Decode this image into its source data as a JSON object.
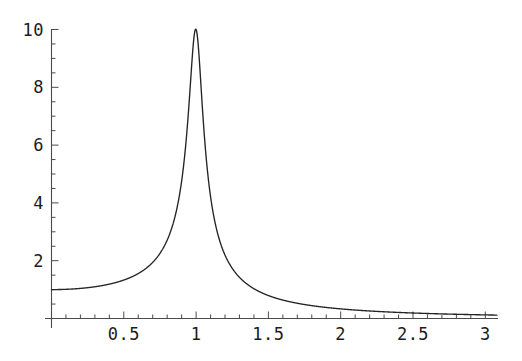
{
  "chart_data": {
    "type": "line",
    "title": "",
    "subtitle": "",
    "xlabel": "",
    "ylabel": "",
    "xlim": [
      0,
      3.08
    ],
    "ylim": [
      0,
      10.35
    ],
    "grid": false,
    "legend": null,
    "annotations": [],
    "line_color": "#242424",
    "axis_color": "#4a4a4a",
    "x_ticks_major": [
      0.5,
      1,
      1.5,
      2,
      2.5,
      3
    ],
    "x_tick_labels": [
      "0.5",
      "1",
      "1.5",
      "2",
      "2.5",
      "3"
    ],
    "x_ticks_minor": [
      0.1,
      0.2,
      0.3,
      0.4,
      0.6,
      0.7,
      0.8,
      0.9,
      1.1,
      1.2,
      1.3,
      1.4,
      1.6,
      1.7,
      1.8,
      1.9,
      2.1,
      2.2,
      2.3,
      2.4,
      2.6,
      2.7,
      2.8,
      2.9
    ],
    "y_ticks_major": [
      2,
      4,
      6,
      8,
      10
    ],
    "y_tick_labels": [
      "2",
      "4",
      "6",
      "8",
      "10"
    ],
    "y_ticks_minor": [
      0.5,
      1,
      1.5,
      2.5,
      3,
      3.5,
      4.5,
      5,
      5.5,
      6.5,
      7,
      7.5,
      8.5,
      9,
      9.5
    ],
    "peak": {
      "x": 1,
      "y": 10
    },
    "start_value": {
      "x": 0,
      "y": 1
    },
    "end_value": {
      "x": 3,
      "y": 0.13
    },
    "series": [
      {
        "name": "resonance amplitude",
        "x": [
          0,
          0.05,
          0.1,
          0.15,
          0.2,
          0.25,
          0.3,
          0.35,
          0.4,
          0.45,
          0.5,
          0.55,
          0.6,
          0.65,
          0.7,
          0.75,
          0.8,
          0.82,
          0.84,
          0.86,
          0.88,
          0.9,
          0.91,
          0.92,
          0.93,
          0.94,
          0.95,
          0.96,
          0.97,
          0.98,
          0.99,
          1.0,
          1.01,
          1.02,
          1.03,
          1.04,
          1.05,
          1.06,
          1.07,
          1.08,
          1.1,
          1.12,
          1.14,
          1.16,
          1.18,
          1.2,
          1.25,
          1.3,
          1.35,
          1.4,
          1.45,
          1.5,
          1.6,
          1.7,
          1.8,
          1.9,
          2.0,
          2.1,
          2.2,
          2.3,
          2.4,
          2.5,
          2.6,
          2.7,
          2.8,
          2.9,
          3.0
        ],
        "y": [
          1.0,
          1.0,
          1.01,
          1.02,
          1.04,
          1.07,
          1.1,
          1.14,
          1.19,
          1.25,
          1.33,
          1.43,
          1.56,
          1.73,
          1.96,
          2.28,
          2.76,
          3.03,
          3.36,
          3.77,
          4.27,
          4.89,
          5.24,
          5.61,
          6.0,
          6.42,
          6.84,
          7.26,
          7.67,
          8.03,
          8.33,
          10.0,
          8.33,
          8.03,
          7.67,
          7.26,
          6.84,
          6.42,
          6.0,
          5.61,
          4.89,
          4.27,
          3.77,
          3.36,
          3.03,
          2.76,
          2.28,
          1.96,
          1.73,
          1.56,
          1.43,
          1.33,
          1.19,
          1.04,
          0.92,
          0.81,
          0.7,
          0.6,
          0.52,
          0.45,
          0.4,
          0.36,
          0.32,
          0.28,
          0.25,
          0.22,
          0.2
        ]
      }
    ]
  },
  "axes": {
    "y_labels": [
      "10",
      "8",
      "6",
      "4",
      "2"
    ],
    "x_labels": [
      "0.5",
      "1",
      "1.5",
      "2",
      "2.5",
      "3"
    ]
  }
}
